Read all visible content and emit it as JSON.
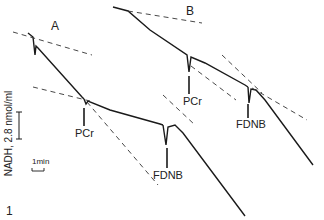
{
  "figure": {
    "panel_a_label": "A",
    "panel_b_label": "B",
    "y_axis_label": "NADH, 2.8 nmol/ml",
    "time_scale_label": "1min",
    "corner_mark": "1",
    "annotations": {
      "a_pcr": "PCr",
      "a_fdnb": "FDNB",
      "b_pcr": "PCr",
      "b_fdnb": "FDNB"
    }
  },
  "colors": {
    "trace": "#1a1a1a",
    "background": "#ffffff"
  }
}
